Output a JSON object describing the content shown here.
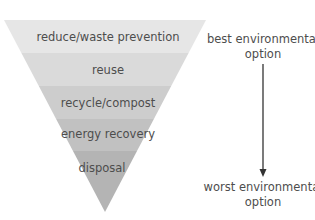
{
  "diagram": {
    "type": "inverted-pyramid",
    "levels": [
      {
        "label": "reduce/waste prevention",
        "color": "#e6e6e6"
      },
      {
        "label": "reuse",
        "color": "#dadada"
      },
      {
        "label": "recycle/compost",
        "color": "#cdcdcd"
      },
      {
        "label": "energy recovery",
        "color": "#c1c1c1"
      },
      {
        "label": "disposal",
        "color": "#b4b4b4"
      }
    ],
    "scale": {
      "top_label": "best environmental option",
      "top_label_line1": "best environmental",
      "top_label_line2": "option",
      "bottom_label": "worst environmental option",
      "bottom_label_line1": "worst environmental",
      "bottom_label_line2": "option",
      "arrow_direction": "down",
      "arrow_color": "#333333"
    }
  }
}
